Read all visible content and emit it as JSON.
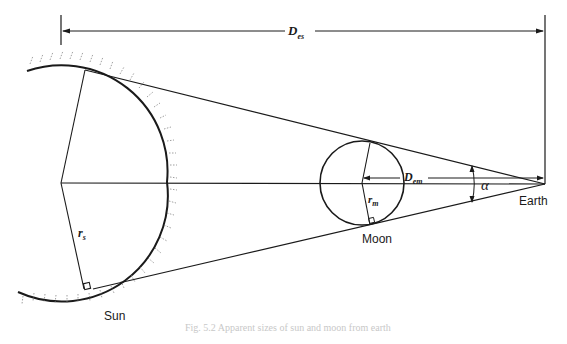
{
  "diagram": {
    "type": "geometric diagram",
    "labels": {
      "sun": "Sun",
      "moon": "Moon",
      "earth": "Earth",
      "d_es_main": "D",
      "d_es_sub": "es",
      "d_em_main": "D",
      "d_em_sub": "em",
      "r_s_main": "r",
      "r_s_sub": "s",
      "r_m_main": "r",
      "r_m_sub": "m",
      "alpha": "α"
    },
    "caption": "Fig. 5.2 Apparent sizes of sun and moon from earth"
  }
}
